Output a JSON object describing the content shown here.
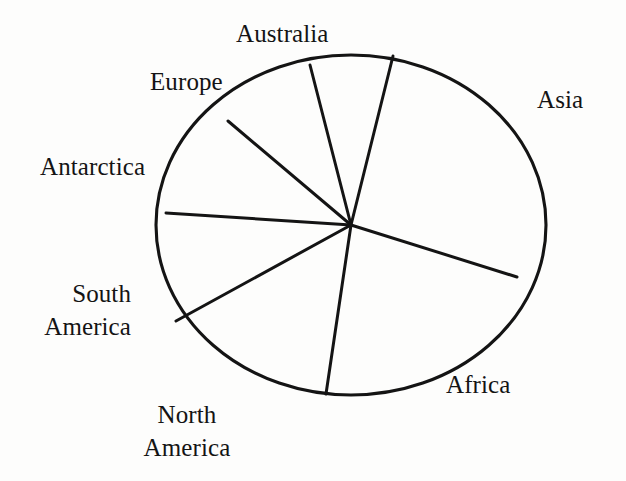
{
  "figure": {
    "kind": "pie-chart",
    "title": "",
    "stroke_color": "#141414",
    "fill_color": "none",
    "text_color": "#141414"
  },
  "labels": {
    "australia": "Australia",
    "asia": "Asia",
    "europe": "Europe",
    "antarctica": "Antarctica",
    "south_america_line1": "South",
    "south_america_line2": "America",
    "north_america_line1": "North",
    "north_america_line2": "America",
    "africa": "Africa"
  },
  "chart_data": {
    "type": "pie",
    "title": "",
    "xlabel": "",
    "ylabel": "",
    "legend": "none",
    "grid": false,
    "labels_position": "outside",
    "unit": "percent_of_circle",
    "center": {
      "x": 351,
      "y": 225
    },
    "radius": {
      "rx": 195,
      "ry": 170
    },
    "categories": [
      "Asia",
      "Australia",
      "Europe",
      "Antarctica",
      "South America",
      "North America",
      "Africa"
    ],
    "values": [
      26.1,
      7.9,
      9.8,
      10.1,
      14.8,
      14.7,
      16.6
    ],
    "slices": [
      {
        "name": "Asia",
        "start_deg": 17.4,
        "end_deg": -76.0,
        "sweep_deg": 93.4,
        "value": 26.1
      },
      {
        "name": "Australia",
        "start_deg": -76.0,
        "end_deg": -104.4,
        "sweep_deg": 28.4,
        "value": 7.9
      },
      {
        "name": "Europe",
        "start_deg": -104.4,
        "end_deg": -139.8,
        "sweep_deg": 35.4,
        "value": 9.8
      },
      {
        "name": "Antarctica",
        "start_deg": -139.8,
        "end_deg": -176.3,
        "sweep_deg": 36.5,
        "value": 10.1
      },
      {
        "name": "South America",
        "start_deg": -176.3,
        "end_deg": 151.3,
        "sweep_deg": 32.4,
        "value": 14.8
      },
      {
        "name": "North America",
        "start_deg": 151.3,
        "end_deg": 98.4,
        "sweep_deg": 52.9,
        "value": 14.7
      },
      {
        "name": "Africa",
        "start_deg": 98.4,
        "end_deg": 17.4,
        "sweep_deg": 81.0,
        "value": 16.6
      }
    ],
    "boundary_points": [
      {
        "between": "Africa/Asia",
        "x": 517,
        "y": 277
      },
      {
        "between": "Asia/Australia",
        "x": 393,
        "y": 56
      },
      {
        "between": "Australia/Europe",
        "x": 310,
        "y": 65
      },
      {
        "between": "Europe/Antarctica",
        "x": 228,
        "y": 121
      },
      {
        "between": "Antarctica/South America",
        "x": 166,
        "y": 213
      },
      {
        "between": "South America/North America",
        "x": 176,
        "y": 321
      },
      {
        "between": "North America/Africa",
        "x": 326,
        "y": 394
      }
    ]
  }
}
